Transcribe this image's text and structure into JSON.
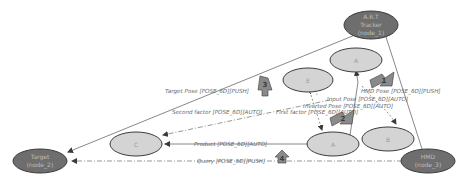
{
  "diagram": {
    "type": "spatial-relationship-graph",
    "nodes": {
      "art_tracker": {
        "line1": "A.R.T",
        "line2": "Tracker",
        "line3": "(node_1)"
      },
      "target": {
        "line1": "Target",
        "line2": "(node_2)"
      },
      "hmd": {
        "line1": "HMD",
        "line2": "(node_3)"
      },
      "a_top": {
        "label": "A"
      },
      "e_top": {
        "label": "E"
      },
      "c": {
        "label": "C"
      },
      "a_bottom": {
        "label": "A"
      },
      "b": {
        "label": "B"
      }
    },
    "edges": {
      "target_pose": "Target Pose  [POSE_6D][PUSH]",
      "hmd_pose": "HMD Pose  [POSE_6D][PUSH]",
      "input_pose": "Input Pose  [POSE_6D][AUTO]",
      "inverted_pose": "Inverted Pose  [POSE_6D][AUTO]",
      "second_factor": "Second factor  [POSE_6D][AUTO]",
      "first_factor": "First factor  [POSE_6D][AUTO]",
      "product": "Product  [POSE_6D][AUTO]",
      "query": "Query  [POSE_6D][PUSH]"
    },
    "badges": {
      "b1": "1",
      "b2": "2",
      "b3": "3",
      "b4": "4"
    },
    "colors": {
      "dark_node_fill": "#6e6e6e",
      "light_node_fill": "#d4d4d4",
      "node_stroke": "#3c3c3c",
      "edge": "#6a6a6a",
      "badge_fill": "#8a8a8a"
    }
  }
}
